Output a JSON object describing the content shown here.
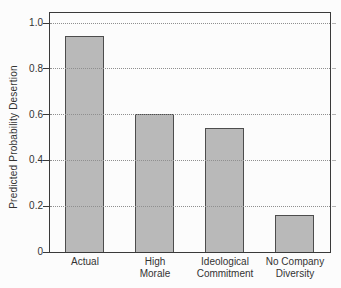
{
  "chart_data": {
    "type": "bar",
    "title": "",
    "xlabel": "",
    "ylabel": "Predicted Probability Desertion",
    "categories": [
      "Actual",
      "High Morale",
      "Ideological Commitment",
      "No Company Diversity"
    ],
    "category_lines": [
      [
        "Actual"
      ],
      [
        "High",
        "Morale"
      ],
      [
        "Ideological",
        "Commitment"
      ],
      [
        "No Company",
        "Diversity"
      ]
    ],
    "values": [
      0.94,
      0.6,
      0.54,
      0.16
    ],
    "ylim": [
      0,
      1.0
    ],
    "yticks": [
      0,
      0.2,
      0.4,
      0.6,
      0.8,
      1.0
    ],
    "ytick_labels": [
      "0",
      "0.2",
      "0.4",
      "0.6",
      "0.8",
      "1.0"
    ],
    "gridline_levels": [
      0.2,
      0.4,
      0.6,
      0.8,
      1.0
    ],
    "grid": "horizontal-dotted",
    "legend_position": "none",
    "colors": {
      "bar_fill": "#b9b9b9",
      "bar_border": "#4d4d4d",
      "plot_border": "#3a3a3a",
      "gridline": "#8f8f8f",
      "left_tick": "#3a3a3a",
      "right_tick": "#b3b3b3",
      "text": "#333333",
      "background": "#fcfcfc"
    }
  }
}
